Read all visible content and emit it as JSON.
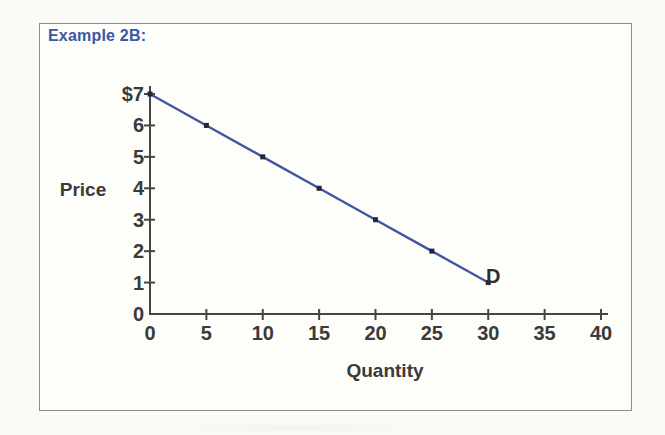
{
  "header": {
    "example_label": "Example 2B:"
  },
  "colors": {
    "heading_blue": "#3a57a8",
    "line_blue": "#4254a4",
    "marker_dark": "#26263a",
    "axis_gray": "#454545",
    "text_dark": "#3a3a3a",
    "frame_border": "#8e8e8a",
    "page_bg": "#fafaf6",
    "frame_bg": "#fdfdf9"
  },
  "chart_data": {
    "type": "line",
    "title": "",
    "xlabel": "Quantity",
    "ylabel": "Price",
    "xlim": [
      0,
      40
    ],
    "ylim": [
      0,
      7
    ],
    "x_ticks": [
      0,
      5,
      10,
      15,
      20,
      25,
      30,
      35,
      40
    ],
    "y_ticks": [
      0,
      1,
      2,
      3,
      4,
      5,
      6,
      7
    ],
    "y_tick_labels": [
      "0",
      "1",
      "2",
      "3",
      "4",
      "5",
      "6",
      "$7"
    ],
    "grid": false,
    "legend_position": "none",
    "series": [
      {
        "name": "D",
        "label": "D",
        "x": [
          0,
          5,
          10,
          15,
          20,
          25,
          30
        ],
        "y": [
          7,
          6,
          5,
          4,
          3,
          2,
          1
        ],
        "color": "#4254a4",
        "marker": "square"
      }
    ]
  }
}
